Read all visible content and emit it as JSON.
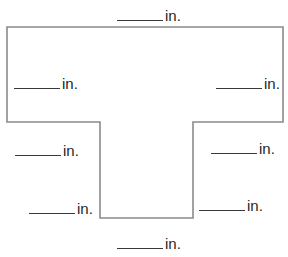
{
  "figure": {
    "type": "T-shaped polygon with dimension blanks",
    "stroke_color": "#8a8a8a",
    "text_color": "#1f1f1f",
    "background": "#ffffff",
    "polygon_points": [
      [
        7,
        27
      ],
      [
        283,
        27
      ],
      [
        283,
        122
      ],
      [
        193,
        122
      ],
      [
        193,
        218
      ],
      [
        100,
        218
      ],
      [
        100,
        122
      ],
      [
        7,
        122
      ]
    ]
  },
  "labels": [
    {
      "id": "top",
      "blank": "______",
      "unit": "in.",
      "x": 117,
      "y": 5
    },
    {
      "id": "left-upper",
      "blank": "______",
      "unit": "in.",
      "x": 14,
      "y": 73
    },
    {
      "id": "right-upper",
      "blank": "______",
      "unit": "in.",
      "x": 216,
      "y": 73
    },
    {
      "id": "left-middle",
      "blank": "______",
      "unit": "in.",
      "x": 15,
      "y": 140
    },
    {
      "id": "right-middle",
      "blank": "______",
      "unit": "in.",
      "x": 211,
      "y": 138
    },
    {
      "id": "left-lower",
      "blank": "______",
      "unit": "in.",
      "x": 29,
      "y": 198
    },
    {
      "id": "right-lower",
      "blank": "______",
      "unit": "in.",
      "x": 199,
      "y": 195
    },
    {
      "id": "bottom",
      "blank": "______",
      "unit": "in.",
      "x": 117,
      "y": 233
    }
  ]
}
